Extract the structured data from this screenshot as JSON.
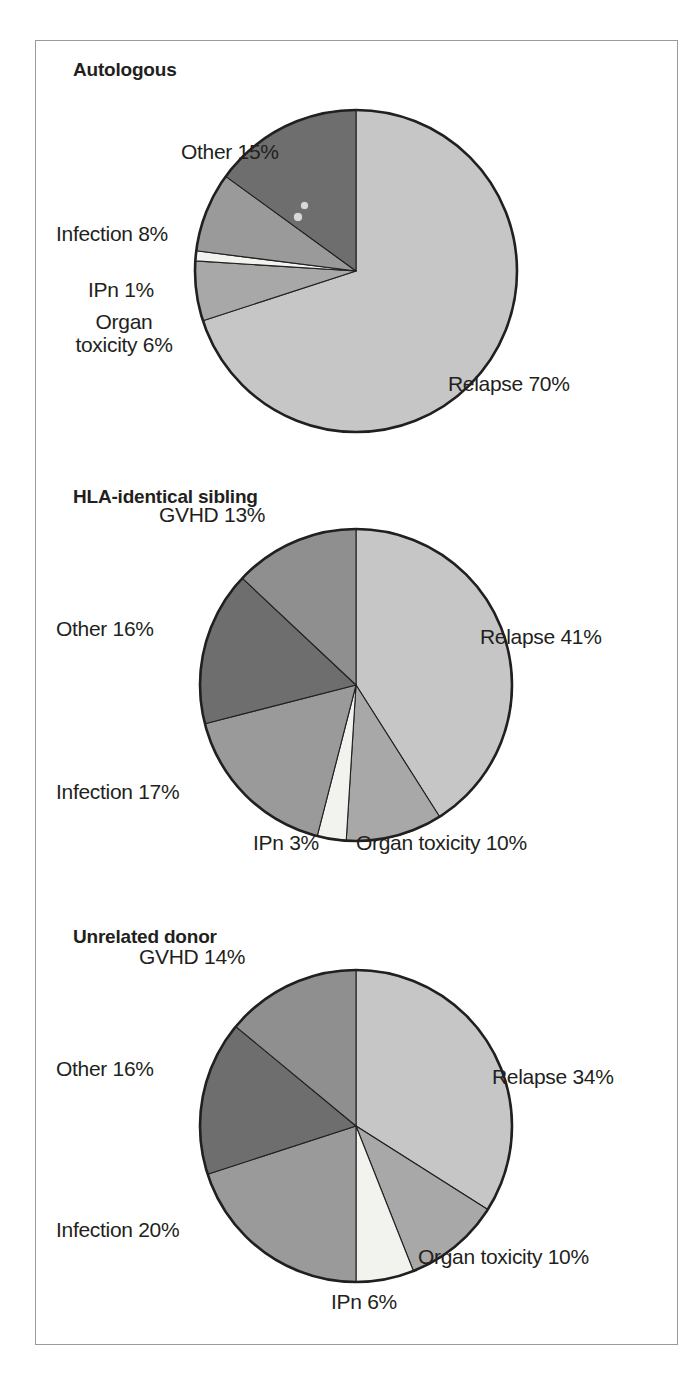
{
  "figure": {
    "border_color": "#9a9a9a",
    "background": "#ffffff",
    "text_color": "#231f20"
  },
  "palette": {
    "relapse": "#c6c6c6",
    "organ_toxicity": "#a8a8a8",
    "ipn": "#f2f2ef",
    "infection": "#9a9a9a",
    "other": "#6e6e6e",
    "gvhd": "#8f8f8f",
    "outline": "#231f20"
  },
  "panels": [
    {
      "id": "autologous",
      "title": "Autologous",
      "labels": [
        {
          "name": "other-label",
          "text": "Other 15%",
          "x": 145,
          "y": 100,
          "align": "left"
        },
        {
          "name": "infection-label",
          "text": "Infection 8%",
          "x": 163,
          "y": 170,
          "align": "left"
        },
        {
          "name": "ipn-label",
          "text": "IPn 1%",
          "x": 171,
          "y": 215,
          "align": "left"
        },
        {
          "name": "organ-toxicity-label",
          "text": "Organ\ntoxicity 6%",
          "x": 172,
          "y": 250,
          "align": "left"
        },
        {
          "name": "relapse-label",
          "text": "Relapse 70%",
          "x": 483,
          "y": 343,
          "align": "left"
        }
      ]
    },
    {
      "id": "hla-identical-sibling",
      "title": "HLA-identical sibling",
      "labels": [
        {
          "name": "gvhd-label",
          "text": "GVHD 13%",
          "x": 258,
          "y": 57,
          "align": "left"
        },
        {
          "name": "other-label",
          "text": "Other 16%",
          "x": 168,
          "y": 175,
          "align": "left"
        },
        {
          "name": "infection-label",
          "text": "Infection 17%",
          "x": 164,
          "y": 330,
          "align": "left"
        },
        {
          "name": "ipn-label",
          "text": "IPn 3%",
          "x": 295,
          "y": 381,
          "align": "left"
        },
        {
          "name": "organ-toxicity-label",
          "text": "Organ toxicity 10%",
          "x": 401,
          "y": 381,
          "align": "left"
        },
        {
          "name": "relapse-label",
          "text": "Relapse 41%",
          "x": 482,
          "y": 175,
          "align": "left"
        }
      ]
    },
    {
      "id": "unrelated-donor",
      "title": "Unrelated donor",
      "labels": [
        {
          "name": "gvhd-label",
          "text": "GVHD 14%",
          "x": 238,
          "y": 58,
          "align": "left"
        },
        {
          "name": "other-label",
          "text": "Other 16%",
          "x": 168,
          "y": 175,
          "align": "left"
        },
        {
          "name": "infection-label",
          "text": "Infection 20%",
          "x": 163,
          "y": 330,
          "align": "left"
        },
        {
          "name": "ipn-label",
          "text": "IPn 6%",
          "x": 373,
          "y": 383,
          "align": "left"
        },
        {
          "name": "organ-toxicity-label",
          "text": "Organ toxicity 10%",
          "x": 460,
          "y": 341,
          "align": "left"
        },
        {
          "name": "relapse-label",
          "text": "Relapse 34%",
          "x": 494,
          "y": 175,
          "align": "left"
        }
      ]
    }
  ],
  "chart_data": [
    {
      "type": "pie",
      "title": "Autologous",
      "categories": [
        "Relapse",
        "Organ toxicity",
        "IPn",
        "Infection",
        "Other"
      ],
      "values": [
        70,
        6,
        1,
        8,
        15
      ],
      "unit": "%",
      "labels": [
        "Relapse 70%",
        "Organ toxicity 6%",
        "IPn 1%",
        "Infection 8%",
        "Other 15%"
      ],
      "colors": [
        "#c6c6c6",
        "#a8a8a8",
        "#f2f2ef",
        "#9a9a9a",
        "#6e6e6e"
      ],
      "start_angle_deg": 0,
      "direction": "clockwise",
      "legend": "none",
      "grid": false
    },
    {
      "type": "pie",
      "title": "HLA-identical sibling",
      "categories": [
        "Relapse",
        "Organ toxicity",
        "IPn",
        "Infection",
        "Other",
        "GVHD"
      ],
      "values": [
        41,
        10,
        3,
        17,
        16,
        13
      ],
      "unit": "%",
      "labels": [
        "Relapse 41%",
        "Organ toxicity 10%",
        "IPn 3%",
        "Infection 17%",
        "Other 16%",
        "GVHD 13%"
      ],
      "colors": [
        "#c6c6c6",
        "#a8a8a8",
        "#f2f2ef",
        "#9a9a9a",
        "#6e6e6e",
        "#8f8f8f"
      ],
      "start_angle_deg": 0,
      "direction": "clockwise",
      "legend": "none",
      "grid": false
    },
    {
      "type": "pie",
      "title": "Unrelated donor",
      "categories": [
        "Relapse",
        "Organ toxicity",
        "IPn",
        "Infection",
        "Other",
        "GVHD"
      ],
      "values": [
        34,
        10,
        6,
        20,
        16,
        14
      ],
      "unit": "%",
      "labels": [
        "Relapse 34%",
        "Organ toxicity 10%",
        "IPn 6%",
        "Infection 20%",
        "Other 16%",
        "GVHD 14%"
      ],
      "colors": [
        "#c6c6c6",
        "#a8a8a8",
        "#f2f2ef",
        "#9a9a9a",
        "#6e6e6e",
        "#8f8f8f"
      ],
      "start_angle_deg": 0,
      "direction": "clockwise",
      "legend": "none",
      "grid": false
    }
  ]
}
